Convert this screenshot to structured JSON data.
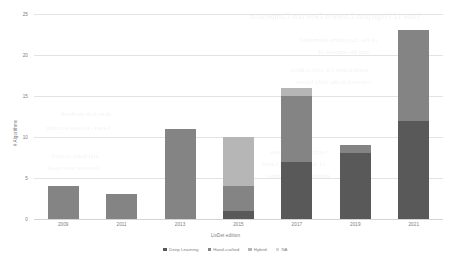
{
  "chart_data": {
    "type": "bar",
    "stacked": true,
    "title": "",
    "xlabel": "LivDet edition",
    "ylabel": "# Algorithms",
    "categories": [
      "2009",
      "2011",
      "2013",
      "2015",
      "2017",
      "2019",
      "2021"
    ],
    "ylim": [
      0,
      25
    ],
    "yticks": [
      "0",
      "5",
      "10",
      "15",
      "20",
      "25"
    ],
    "grid": "horizontal",
    "legend_position": "bottom",
    "series": [
      {
        "name": "Deep Learning",
        "color": "#595959",
        "values": [
          0,
          0,
          0,
          1,
          7,
          8,
          12
        ]
      },
      {
        "name": "Hand-crafted",
        "color": "#848484",
        "values": [
          4,
          3,
          11,
          3,
          8,
          1,
          11
        ]
      },
      {
        "name": "Hybrid",
        "color": "#b6b6b6",
        "values": [
          0,
          0,
          0,
          6,
          1,
          0,
          0
        ]
      },
      {
        "name": "NA",
        "color": "#d8d8d8",
        "values": [
          0,
          0,
          0,
          0,
          0,
          0,
          0
        ]
      }
    ],
    "totals": [
      4,
      3,
      11,
      10,
      16,
      9,
      23
    ]
  },
  "ghost_text": [
    {
      "text": "Table 12  Fingerprint Liveness Detection Competition",
      "x": 250,
      "y": 12,
      "size": 8
    },
    {
      "text": "of the algorithms submitted",
      "x": 300,
      "y": 36,
      "size": 7
    },
    {
      "text": "and the number of",
      "x": 318,
      "y": 48,
      "size": 7
    },
    {
      "text": "participants for each edition",
      "x": 290,
      "y": 66,
      "size": 7
    },
    {
      "text": "reported in the table below",
      "x": 296,
      "y": 78,
      "size": 7
    },
    {
      "text": "detection methods",
      "x": 60,
      "y": 110,
      "size": 7
    },
    {
      "text": "based on deep learning",
      "x": 46,
      "y": 124,
      "size": 7
    },
    {
      "text": "and hand crafted",
      "x": 52,
      "y": 152,
      "size": 7
    },
    {
      "text": "features were used",
      "x": 48,
      "y": 164,
      "size": 7
    },
    {
      "text": "a significant increase",
      "x": 270,
      "y": 148,
      "size": 7
    },
    {
      "text": "of deep learning based",
      "x": 262,
      "y": 160,
      "size": 7
    },
    {
      "text": "submissions over time",
      "x": 268,
      "y": 172,
      "size": 7
    }
  ]
}
